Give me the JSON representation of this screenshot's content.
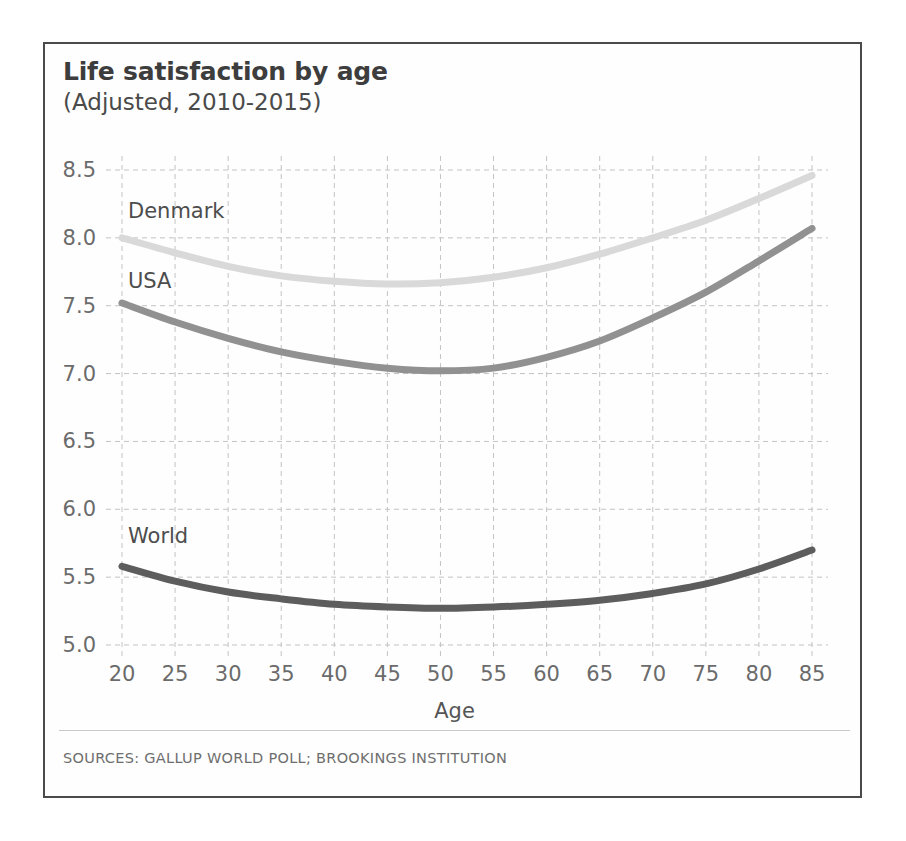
{
  "chart_data": {
    "type": "line",
    "title": "Life satisfaction by age",
    "subtitle": "(Adjusted, 2010-2015)",
    "xlabel": "Age",
    "ylabel": "",
    "xlim": [
      20,
      85
    ],
    "ylim": [
      5.0,
      8.5
    ],
    "grid": true,
    "legend_position": "inline-labels",
    "x_ticks": [
      20,
      25,
      30,
      35,
      40,
      45,
      50,
      55,
      60,
      65,
      70,
      75,
      80,
      85
    ],
    "y_ticks": [
      "5.0",
      "5.5",
      "6.0",
      "6.5",
      "7.0",
      "7.5",
      "8.0",
      "8.5"
    ],
    "x": [
      20,
      25,
      30,
      35,
      40,
      45,
      50,
      55,
      60,
      65,
      70,
      75,
      80,
      85
    ],
    "series": [
      {
        "name": "Denmark",
        "color": "#d9d9d9",
        "label_x": 20,
        "label_y": 8.18,
        "values": [
          8.0,
          7.89,
          7.79,
          7.72,
          7.68,
          7.66,
          7.67,
          7.71,
          7.78,
          7.88,
          8.0,
          8.13,
          8.29,
          8.46
        ]
      },
      {
        "name": "USA",
        "color": "#919191",
        "label_x": 20,
        "label_y": 7.67,
        "values": [
          7.52,
          7.38,
          7.26,
          7.16,
          7.09,
          7.04,
          7.02,
          7.04,
          7.12,
          7.24,
          7.41,
          7.6,
          7.83,
          8.07
        ]
      },
      {
        "name": "World",
        "color": "#5d5d5d",
        "label_x": 20,
        "label_y": 5.79,
        "values": [
          5.58,
          5.47,
          5.39,
          5.34,
          5.3,
          5.28,
          5.27,
          5.28,
          5.3,
          5.33,
          5.38,
          5.45,
          5.56,
          5.7
        ]
      }
    ]
  },
  "footer": {
    "source": "SOURCES: GALLUP WORLD POLL; BROOKINGS INSTITUTION"
  },
  "style": {
    "frame_color": "#4a4a4a",
    "grid_color": "#c3c3c3",
    "tick_color": "#6b6b6b",
    "background": "#ffffff"
  }
}
